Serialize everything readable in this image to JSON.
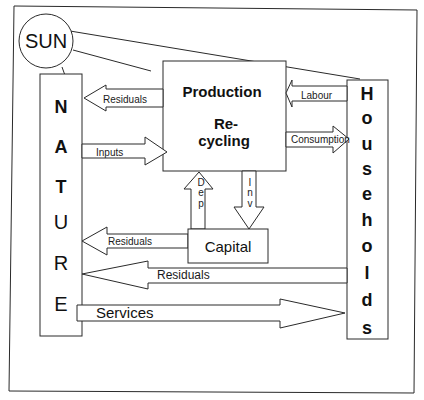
{
  "diagram": {
    "sun": {
      "label": "SUN"
    },
    "nature": {
      "letters": [
        "N",
        "A",
        "T",
        "U",
        "R",
        "E"
      ]
    },
    "households": {
      "letters": [
        "H",
        "o",
        "u",
        "s",
        "e",
        "h",
        "o",
        "l",
        "d",
        "s"
      ]
    },
    "production": {
      "line1": "Production",
      "line2": "Re-",
      "line3": "cycling"
    },
    "capital": {
      "label": "Capital"
    },
    "flows": {
      "residuals_production": "Residuals",
      "inputs": "Inputs",
      "labour": "Labour",
      "consumption": "Consumption",
      "dep": [
        "D",
        "e",
        "p"
      ],
      "inv": [
        "I",
        "n",
        "v"
      ],
      "residuals_capital": "Residuals",
      "residuals_households": "Residuals",
      "services": "Services"
    }
  }
}
